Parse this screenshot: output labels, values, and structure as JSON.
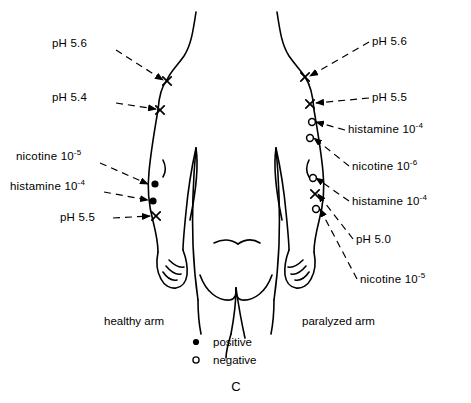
{
  "figure": {
    "label": "C",
    "background_color": "#ffffff",
    "ink_color": "#000000",
    "view": "posterior human torso with both arms"
  },
  "arm_captions": {
    "left": "healthy  arm",
    "right": "paralyzed  arm"
  },
  "legend": {
    "items": [
      {
        "marker": "filled-dot",
        "symbol": "●",
        "label": "positive"
      },
      {
        "marker": "open-circle",
        "symbol": "o",
        "label": "negative"
      }
    ]
  },
  "left_labels": [
    {
      "id": "l1",
      "base": "pH 5.6",
      "exponent": "",
      "marker": "x",
      "x": 52,
      "y": 47,
      "anchor": "start",
      "lead_from": [
        116,
        50
      ],
      "lead_to": [
        163,
        80
      ]
    },
    {
      "id": "l2",
      "base": "pH 5.4",
      "exponent": "",
      "marker": "x",
      "x": 52,
      "y": 101,
      "anchor": "start",
      "lead_from": [
        116,
        103
      ],
      "lead_to": [
        156,
        109
      ]
    },
    {
      "id": "l3",
      "base": "nicotine 10",
      "exponent": "-5",
      "marker": "filled-dot",
      "x": 16,
      "y": 160,
      "anchor": "start",
      "lead_from": [
        100,
        163
      ],
      "lead_to": [
        148,
        184
      ]
    },
    {
      "id": "l4",
      "base": "histamine 10",
      "exponent": "-4",
      "marker": "filled-dot",
      "x": 10,
      "y": 190,
      "anchor": "start",
      "lead_from": [
        104,
        192
      ],
      "lead_to": [
        148,
        200
      ]
    },
    {
      "id": "l5",
      "base": "pH 5.5",
      "exponent": "",
      "marker": "x",
      "x": 60,
      "y": 221,
      "anchor": "start",
      "lead_from": [
        113,
        218
      ],
      "lead_to": [
        150,
        216
      ]
    }
  ],
  "right_labels": [
    {
      "id": "r1",
      "base": "pH 5.6",
      "exponent": "",
      "marker": "x",
      "x": 372,
      "y": 45,
      "anchor": "start",
      "lead_from": [
        369,
        42
      ],
      "lead_to": [
        310,
        76
      ]
    },
    {
      "id": "r2",
      "base": "pH 5.5",
      "exponent": "",
      "marker": "x",
      "x": 372,
      "y": 101,
      "anchor": "start",
      "lead_from": [
        369,
        98
      ],
      "lead_to": [
        316,
        103
      ]
    },
    {
      "id": "r3",
      "base": "histamine 10",
      "exponent": "-4",
      "marker": "open-circle",
      "x": 348,
      "y": 133,
      "anchor": "start",
      "lead_from": [
        345,
        130
      ],
      "lead_to": [
        316,
        122
      ]
    },
    {
      "id": "r4",
      "base": "nicotine 10",
      "exponent": "-6",
      "marker": "open-circle",
      "x": 352,
      "y": 170,
      "anchor": "start",
      "lead_from": [
        349,
        166
      ],
      "lead_to": [
        314,
        138
      ]
    },
    {
      "id": "r5",
      "base": "histamine 10",
      "exponent": "-4",
      "marker": "open-circle",
      "x": 352,
      "y": 205,
      "anchor": "start",
      "lead_from": [
        349,
        201
      ],
      "lead_to": [
        316,
        178
      ]
    },
    {
      "id": "r6",
      "base": "pH 5.0",
      "exponent": "",
      "marker": "x",
      "x": 356,
      "y": 243,
      "anchor": "start",
      "lead_from": [
        353,
        239
      ],
      "lead_to": [
        318,
        194
      ]
    },
    {
      "id": "r7",
      "base": "nicotine 10",
      "exponent": "-5",
      "marker": "open-circle",
      "x": 360,
      "y": 283,
      "anchor": "start",
      "lead_from": [
        357,
        279
      ],
      "lead_to": [
        320,
        209
      ]
    }
  ],
  "left_markers": [
    {
      "type": "x",
      "x": 167,
      "y": 81
    },
    {
      "type": "x",
      "x": 160,
      "y": 110
    },
    {
      "type": "filled-dot",
      "x": 155,
      "y": 184
    },
    {
      "type": "filled-dot",
      "x": 153,
      "y": 201
    },
    {
      "type": "x",
      "x": 156,
      "y": 216
    }
  ],
  "right_markers": [
    {
      "type": "x",
      "x": 305,
      "y": 77
    },
    {
      "type": "x",
      "x": 310,
      "y": 104
    },
    {
      "type": "open-circle",
      "x": 312,
      "y": 122
    },
    {
      "type": "open-circle",
      "x": 310,
      "y": 138
    },
    {
      "type": "open-circle",
      "x": 313,
      "y": 178
    },
    {
      "type": "x",
      "x": 315,
      "y": 194
    },
    {
      "type": "open-circle",
      "x": 316,
      "y": 209
    }
  ]
}
